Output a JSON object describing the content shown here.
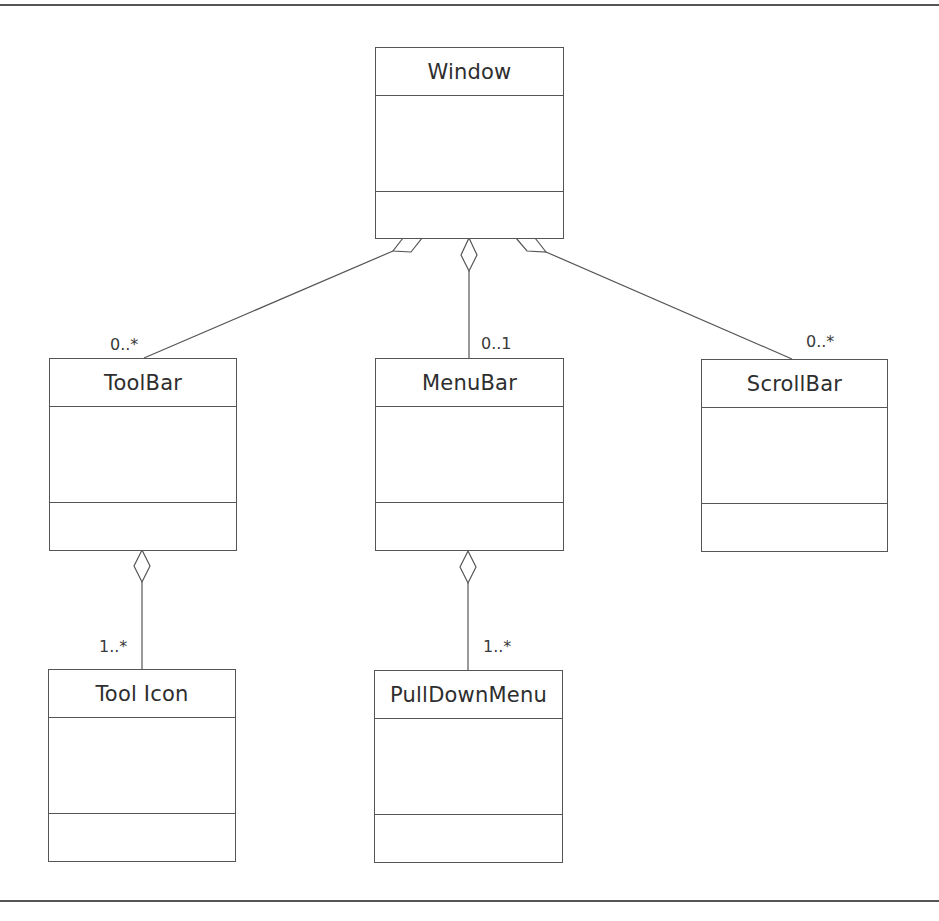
{
  "diagram": {
    "type": "uml-class-diagram",
    "classes": [
      {
        "id": "window",
        "name": "Window"
      },
      {
        "id": "toolbar",
        "name": "ToolBar"
      },
      {
        "id": "menubar",
        "name": "MenuBar"
      },
      {
        "id": "scrollbar",
        "name": "ScrollBar"
      },
      {
        "id": "toolicon",
        "name": "Tool Icon"
      },
      {
        "id": "pulldownmenu",
        "name": "PullDownMenu"
      }
    ],
    "relationships": [
      {
        "type": "aggregation",
        "whole": "Window",
        "part": "ToolBar",
        "multiplicity": "0..*"
      },
      {
        "type": "aggregation",
        "whole": "Window",
        "part": "MenuBar",
        "multiplicity": "0..1"
      },
      {
        "type": "aggregation",
        "whole": "Window",
        "part": "ScrollBar",
        "multiplicity": "0..*"
      },
      {
        "type": "aggregation",
        "whole": "ToolBar",
        "part": "Tool Icon",
        "multiplicity": "1..*"
      },
      {
        "type": "aggregation",
        "whole": "MenuBar",
        "part": "PullDownMenu",
        "multiplicity": "1..*"
      }
    ]
  },
  "colors": {
    "line": "#555555",
    "text": "#2e2e2e",
    "background": "#ffffff"
  }
}
